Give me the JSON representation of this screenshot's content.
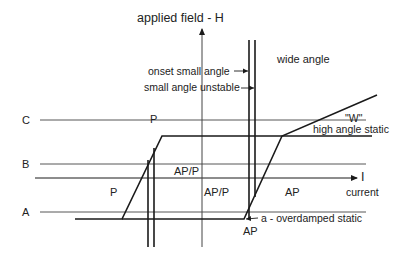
{
  "diagram": {
    "axes": {
      "vertical_label": "applied field - H",
      "horizontal_label": "I",
      "horizontal_sublabel": "current"
    },
    "field_levels": [
      {
        "name": "C",
        "label": "C"
      },
      {
        "name": "B",
        "label": "B"
      },
      {
        "name": "A",
        "label": "A"
      }
    ],
    "region_labels": {
      "p_top": "P",
      "p_left": "P",
      "ap_p_upper": "AP/P",
      "ap_p_center": "AP/P",
      "ap_right": "AP",
      "ap_bottom": "AP",
      "wide_angle": "wide angle",
      "w": "\"W\"",
      "high_angle_static": "high angle static"
    },
    "annotations": {
      "onset_small_angle": "onset small angle",
      "small_angle_unstable": "small angle unstable",
      "overdamped_static": "a - overdamped static"
    },
    "colors": {
      "line": "#1a1a1a",
      "thin_line": "#444444",
      "background": "#ffffff"
    }
  }
}
